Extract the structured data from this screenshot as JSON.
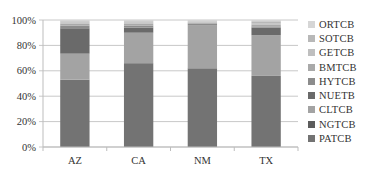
{
  "chart_data": {
    "type": "bar",
    "stacked": true,
    "percent_stacked": true,
    "title": "",
    "xlabel": "",
    "ylabel": "",
    "ylim": [
      0,
      100
    ],
    "yticks": [
      "0%",
      "20%",
      "40%",
      "60%",
      "80%",
      "100%"
    ],
    "categories": [
      "AZ",
      "CA",
      "NM",
      "TX"
    ],
    "grid": true,
    "legend_position": "right",
    "series": [
      {
        "name": "PATCB",
        "color": "#737373",
        "values": [
          53,
          66,
          62,
          56
        ]
      },
      {
        "name": "NGTCB",
        "color": "#5c5c5c",
        "values": [
          0,
          0,
          0,
          0
        ]
      },
      {
        "name": "CLTCB",
        "color": "#a3a3a3",
        "values": [
          20.5,
          24,
          34,
          32
        ]
      },
      {
        "name": "NUETB",
        "color": "#6a6a6a",
        "values": [
          20,
          4,
          0,
          6
        ]
      },
      {
        "name": "HYTCB",
        "color": "#8c8c8c",
        "values": [
          2,
          1.5,
          1,
          1
        ]
      },
      {
        "name": "BMTCB",
        "color": "#a9a9a9",
        "values": [
          1.5,
          1.5,
          1,
          1.5
        ]
      },
      {
        "name": "GETCB",
        "color": "#bfbfbf",
        "values": [
          1,
          1,
          0.5,
          1
        ]
      },
      {
        "name": "SOTCB",
        "color": "#b8b8b8",
        "values": [
          1,
          1,
          0.5,
          1.5
        ]
      },
      {
        "name": "ORTCB",
        "color": "#d6d6d6",
        "values": [
          1,
          1,
          1,
          1
        ]
      }
    ],
    "legend_order": [
      "ORTCB",
      "SOTCB",
      "GETCB",
      "BMTCB",
      "HYTCB",
      "NUETB",
      "CLTCB",
      "NGTCB",
      "PATCB"
    ]
  }
}
